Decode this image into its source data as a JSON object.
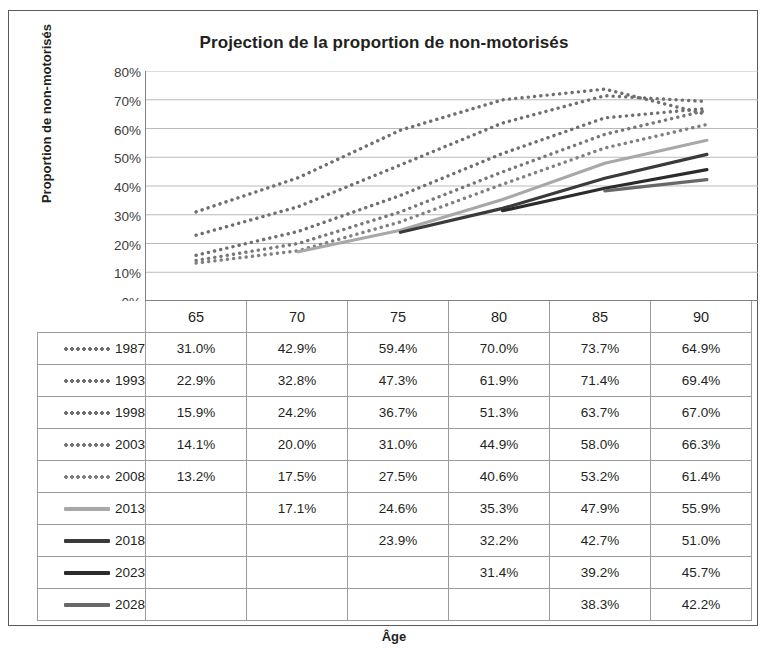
{
  "chart_data": {
    "type": "line",
    "title": "Projection de la proportion de non-motorisés",
    "xlabel": "Âge",
    "ylabel": "Proportion de non-motorisés",
    "categories": [
      "65",
      "70",
      "75",
      "80",
      "85",
      "90"
    ],
    "x": [
      65,
      70,
      75,
      80,
      85,
      90
    ],
    "ylim": [
      0,
      0.8
    ],
    "ytick_labels": [
      "80%",
      "70%",
      "60%",
      "50%",
      "40%",
      "30%",
      "20%",
      "10%",
      "0%"
    ],
    "ytick_values": [
      0.8,
      0.7,
      0.6,
      0.5,
      0.4,
      0.3,
      0.2,
      0.1,
      0.0
    ],
    "grid": true,
    "legend_position": "table-below",
    "series": [
      {
        "name": "1987",
        "style": "dotted",
        "color": "#6f6f6f",
        "values": [
          31.0,
          42.9,
          59.4,
          70.0,
          73.7,
          64.9
        ],
        "labels": [
          "31.0%",
          "42.9%",
          "59.4%",
          "70.0%",
          "73.7%",
          "64.9%"
        ]
      },
      {
        "name": "1993",
        "style": "dotted",
        "color": "#6f6f6f",
        "values": [
          22.9,
          32.8,
          47.3,
          61.9,
          71.4,
          69.4
        ],
        "labels": [
          "22.9%",
          "32.8%",
          "47.3%",
          "61.9%",
          "71.4%",
          "69.4%"
        ]
      },
      {
        "name": "1998",
        "style": "dotted",
        "color": "#6f6f6f",
        "values": [
          15.9,
          24.2,
          36.7,
          51.3,
          63.7,
          67.0
        ],
        "labels": [
          "15.9%",
          "24.2%",
          "36.7%",
          "51.3%",
          "63.7%",
          "67.0%"
        ]
      },
      {
        "name": "2003",
        "style": "dotted",
        "color": "#777777",
        "values": [
          14.1,
          20.0,
          31.0,
          44.9,
          58.0,
          66.3
        ],
        "labels": [
          "14.1%",
          "20.0%",
          "31.0%",
          "44.9%",
          "58.0%",
          "66.3%"
        ]
      },
      {
        "name": "2008",
        "style": "dotted",
        "color": "#808080",
        "values": [
          13.2,
          17.5,
          27.5,
          40.6,
          53.2,
          61.4
        ],
        "labels": [
          "13.2%",
          "17.5%",
          "27.5%",
          "40.6%",
          "53.2%",
          "61.4%"
        ]
      },
      {
        "name": "2013",
        "style": "solid",
        "color": "#a8a8a8",
        "values": [
          null,
          17.1,
          24.6,
          35.3,
          47.9,
          55.9
        ],
        "labels": [
          "",
          "17.1%",
          "24.6%",
          "35.3%",
          "47.9%",
          "55.9%"
        ]
      },
      {
        "name": "2018",
        "style": "solid",
        "color": "#3a3a3a",
        "values": [
          null,
          null,
          23.9,
          32.2,
          42.7,
          51.0
        ],
        "labels": [
          "",
          "",
          "23.9%",
          "32.2%",
          "42.7%",
          "51.0%"
        ]
      },
      {
        "name": "2023",
        "style": "solid",
        "color": "#2b2b2b",
        "values": [
          null,
          null,
          null,
          31.4,
          39.2,
          45.7
        ],
        "labels": [
          "",
          "",
          "",
          "31.4%",
          "39.2%",
          "45.7%"
        ]
      },
      {
        "name": "2028",
        "style": "solid",
        "color": "#686868",
        "values": [
          null,
          null,
          null,
          null,
          38.3,
          42.2
        ],
        "labels": [
          "",
          "",
          "",
          "",
          "38.3%",
          "42.2%"
        ]
      }
    ]
  },
  "table": {
    "header": {
      "corner_label": "",
      "columns": [
        "65",
        "70",
        "75",
        "80",
        "85",
        "90"
      ]
    },
    "rows": [
      {
        "legend": "1987",
        "style": "dotted",
        "color": "#6f6f6f",
        "cells": [
          "31.0%",
          "42.9%",
          "59.4%",
          "70.0%",
          "73.7%",
          "64.9%"
        ]
      },
      {
        "legend": "1993",
        "style": "dotted",
        "color": "#6f6f6f",
        "cells": [
          "22.9%",
          "32.8%",
          "47.3%",
          "61.9%",
          "71.4%",
          "69.4%"
        ]
      },
      {
        "legend": "1998",
        "style": "dotted",
        "color": "#6f6f6f",
        "cells": [
          "15.9%",
          "24.2%",
          "36.7%",
          "51.3%",
          "63.7%",
          "67.0%"
        ]
      },
      {
        "legend": "2003",
        "style": "dotted",
        "color": "#777777",
        "cells": [
          "14.1%",
          "20.0%",
          "31.0%",
          "44.9%",
          "58.0%",
          "66.3%"
        ]
      },
      {
        "legend": "2008",
        "style": "dotted",
        "color": "#808080",
        "cells": [
          "13.2%",
          "17.5%",
          "27.5%",
          "40.6%",
          "53.2%",
          "61.4%"
        ]
      },
      {
        "legend": "2013",
        "style": "solid",
        "color": "#a8a8a8",
        "cells": [
          "",
          "17.1%",
          "24.6%",
          "35.3%",
          "47.9%",
          "55.9%"
        ]
      },
      {
        "legend": "2018",
        "style": "solid",
        "color": "#3a3a3a",
        "cells": [
          "",
          "",
          "23.9%",
          "32.2%",
          "42.7%",
          "51.0%"
        ]
      },
      {
        "legend": "2023",
        "style": "solid",
        "color": "#2b2b2b",
        "cells": [
          "",
          "",
          "",
          "31.4%",
          "39.2%",
          "45.7%"
        ]
      },
      {
        "legend": "2028",
        "style": "solid",
        "color": "#686868",
        "cells": [
          "",
          "",
          "",
          "",
          "38.3%",
          "42.2%"
        ]
      }
    ]
  },
  "colors": {
    "frame_border": "#5a5a5a",
    "grid_line": "#b9b9c4",
    "axis_line": "#808080",
    "table_border": "#9b9b9b",
    "text": "#231f20"
  }
}
